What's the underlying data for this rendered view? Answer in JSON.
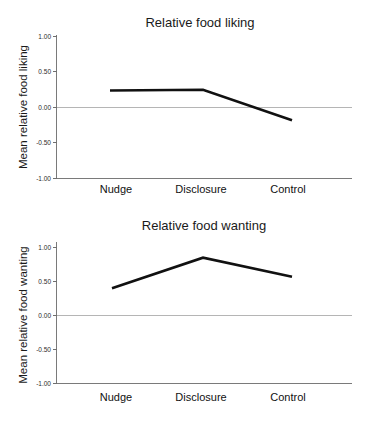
{
  "figure": {
    "name": "relative-food-liking-and-wanting-figure",
    "background_color": "#ffffff",
    "line_color": "#111111",
    "axis_color": "#7a7a7a",
    "zero_line_color": "#b5b5b5"
  },
  "chart_data": [
    {
      "type": "line",
      "name": "relative-food-liking",
      "title": "Relative food liking",
      "xlabel": "",
      "ylabel": "Mean relative food liking",
      "categories": [
        "Nudge",
        "Disclosure",
        "Control"
      ],
      "values": [
        0.24,
        0.25,
        -0.18
      ],
      "yticks": [
        "1.00",
        "0.50",
        "0.00",
        "-0.50",
        "-1.00"
      ],
      "ytick_values": [
        1.0,
        0.5,
        0.0,
        -0.5,
        -1.0
      ],
      "ylim": [
        -1.0,
        1.0
      ],
      "grid": false,
      "legend": false,
      "zero_line": true
    },
    {
      "type": "line",
      "name": "relative-food-wanting",
      "title": "Relative food wanting",
      "xlabel": "",
      "ylabel": "Mean relative food wanting",
      "categories": [
        "Nudge",
        "Disclosure",
        "Control"
      ],
      "values": [
        0.4,
        0.85,
        0.57
      ],
      "yticks": [
        "1.00",
        "0.50",
        "0.00",
        "-0.50",
        "-1.00"
      ],
      "ytick_values": [
        1.0,
        0.5,
        0.0,
        -0.5,
        -1.0
      ],
      "ylim": [
        -1.0,
        1.0
      ],
      "grid": false,
      "legend": false,
      "zero_line": true
    }
  ]
}
